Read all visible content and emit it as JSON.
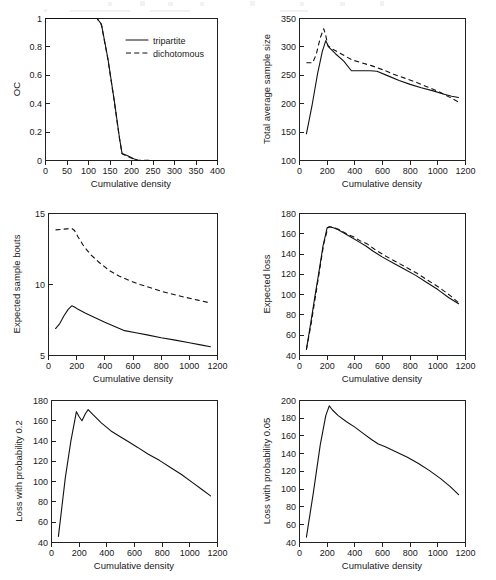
{
  "figure": {
    "panel_count": 6,
    "layout": "3 rows x 2 columns",
    "line_color": "#111111",
    "background": "#ffffff"
  },
  "legend": {
    "position": "inside panel 1, upper right",
    "entries": [
      {
        "label": "tripartite",
        "style": "solid"
      },
      {
        "label": "dichotomous",
        "style": "dashed"
      }
    ]
  },
  "chart_data": [
    {
      "type": "line",
      "title": "",
      "xlabel": "Cumulative density",
      "ylabel": "OC",
      "xlim": [
        0,
        400
      ],
      "ylim": [
        0,
        1
      ],
      "xticks": [
        0,
        50,
        100,
        150,
        200,
        250,
        300,
        350,
        400
      ],
      "yticks": [
        0,
        0.2,
        0.4,
        0.6,
        0.8,
        1
      ],
      "ytick_labels": [
        "0",
        "0.2",
        "0.4",
        "0.6",
        "0.8",
        "1"
      ],
      "grid": false,
      "legend": "upper right",
      "series": [
        {
          "name": "tripartite",
          "style": "solid",
          "x": [
            0,
            60,
            100,
            120,
            130,
            145,
            160,
            172,
            178,
            190,
            205,
            215,
            260,
            320,
            400
          ],
          "y": [
            1,
            1,
            1,
            1,
            0.96,
            0.72,
            0.42,
            0.16,
            0.05,
            0.035,
            0.012,
            0.002,
            0,
            0,
            0
          ]
        },
        {
          "name": "dichotomous",
          "style": "dashed",
          "x": [
            0,
            60,
            100,
            120,
            130,
            145,
            160,
            172,
            178,
            190,
            205,
            215,
            260,
            320,
            400
          ],
          "y": [
            1,
            1,
            1,
            1,
            0.955,
            0.715,
            0.415,
            0.155,
            0.048,
            0.03,
            0.01,
            0.002,
            0,
            0,
            0
          ]
        }
      ]
    },
    {
      "type": "line",
      "title": "",
      "xlabel": "Cumulative density",
      "ylabel": "Total average sample size",
      "xlim": [
        0,
        1200
      ],
      "ylim": [
        100,
        350
      ],
      "xticks": [
        0,
        200,
        400,
        600,
        800,
        1000,
        1200
      ],
      "yticks": [
        100,
        150,
        200,
        250,
        300,
        350
      ],
      "grid": false,
      "series": [
        {
          "name": "tripartite",
          "style": "solid",
          "x": [
            50,
            90,
            130,
            165,
            190,
            210,
            260,
            320,
            375,
            440,
            510,
            560,
            640,
            720,
            800,
            880,
            960,
            1040,
            1100,
            1150
          ],
          "y": [
            147,
            196,
            252,
            292,
            311,
            300,
            288,
            275,
            258,
            258,
            258,
            257,
            249,
            241,
            234,
            228,
            223,
            217,
            213,
            211
          ]
        },
        {
          "name": "dichotomous",
          "style": "dashed",
          "x": [
            50,
            95,
            120,
            150,
            175,
            190,
            205,
            240,
            300,
            380,
            450,
            520,
            600,
            680,
            760,
            840,
            920,
            1000,
            1080,
            1150
          ],
          "y": [
            272,
            272,
            286,
            316,
            332,
            320,
            302,
            296,
            288,
            277,
            272,
            267,
            260,
            252,
            245,
            238,
            230,
            222,
            212,
            203
          ]
        }
      ]
    },
    {
      "type": "line",
      "title": "",
      "xlabel": "Cumulative density",
      "ylabel": "Expected sample bouts",
      "xlim": [
        0,
        1200
      ],
      "ylim": [
        5,
        15
      ],
      "xticks": [
        0,
        200,
        400,
        600,
        800,
        1000,
        1200
      ],
      "yticks": [
        5,
        10,
        15
      ],
      "grid": false,
      "series": [
        {
          "name": "tripartite",
          "style": "solid",
          "x": [
            50,
            80,
            110,
            140,
            165,
            185,
            210,
            260,
            320,
            400,
            470,
            540,
            620,
            700,
            800,
            900,
            1000,
            1080,
            1150
          ],
          "y": [
            6.9,
            7.25,
            7.8,
            8.25,
            8.5,
            8.42,
            8.25,
            8.0,
            7.72,
            7.35,
            7.05,
            6.75,
            6.6,
            6.45,
            6.25,
            6.08,
            5.9,
            5.75,
            5.62
          ]
        },
        {
          "name": "dichotomous",
          "style": "dashed",
          "x": [
            50,
            90,
            130,
            165,
            185,
            210,
            250,
            300,
            360,
            430,
            500,
            570,
            650,
            730,
            810,
            890,
            970,
            1060,
            1150
          ],
          "y": [
            13.85,
            13.88,
            13.92,
            13.95,
            13.8,
            13.35,
            12.7,
            12.1,
            11.55,
            11.0,
            10.6,
            10.3,
            10.0,
            9.75,
            9.5,
            9.3,
            9.1,
            8.9,
            8.7
          ]
        }
      ]
    },
    {
      "type": "line",
      "title": "",
      "xlabel": "Cumulative density",
      "ylabel": "Expected loss",
      "xlim": [
        0,
        1200
      ],
      "ylim": [
        40,
        180
      ],
      "xticks": [
        0,
        200,
        400,
        600,
        800,
        1000,
        1200
      ],
      "yticks": [
        40,
        60,
        80,
        100,
        120,
        140,
        160,
        180
      ],
      "grid": false,
      "series": [
        {
          "name": "tripartite",
          "style": "solid",
          "x": [
            50,
            80,
            110,
            140,
            170,
            200,
            215,
            245,
            280,
            330,
            380,
            430,
            480,
            530,
            600,
            680,
            760,
            840,
            920,
            1000,
            1080,
            1150
          ],
          "y": [
            46,
            71,
            97,
            122,
            148,
            166,
            167,
            166,
            164,
            160,
            156,
            152,
            148,
            143,
            137,
            131,
            125,
            119,
            112,
            105,
            97,
            91
          ]
        },
        {
          "name": "dichotomous",
          "style": "dashed",
          "x": [
            50,
            85,
            115,
            145,
            175,
            205,
            220,
            250,
            290,
            340,
            390,
            440,
            490,
            540,
            610,
            690,
            770,
            850,
            930,
            1010,
            1090,
            1150
          ],
          "y": [
            46,
            72,
            98,
            124,
            150,
            166,
            167,
            166,
            164,
            160,
            157,
            153,
            150,
            145,
            139,
            133,
            127,
            121,
            114,
            107,
            99,
            92
          ]
        }
      ]
    },
    {
      "type": "line",
      "title": "",
      "xlabel": "Cumulative density",
      "ylabel": "Loss with probability 0.2",
      "xlim": [
        0,
        1200
      ],
      "ylim": [
        40,
        180
      ],
      "xticks": [
        0,
        200,
        400,
        600,
        800,
        1000,
        1200
      ],
      "yticks": [
        40,
        60,
        80,
        100,
        120,
        140,
        160,
        180
      ],
      "grid": false,
      "series": [
        {
          "name": "tripartite",
          "style": "solid",
          "x": [
            50,
            100,
            140,
            180,
            200,
            220,
            245,
            265,
            300,
            360,
            430,
            500,
            560,
            620,
            700,
            780,
            860,
            940,
            1020,
            1090,
            1150
          ],
          "y": [
            46,
            104,
            140,
            169,
            164,
            160,
            167,
            171,
            166,
            158,
            150,
            144,
            139,
            134,
            127,
            121,
            114,
            107,
            99,
            92,
            86
          ]
        }
      ]
    },
    {
      "type": "line",
      "title": "",
      "xlabel": "Cumulative density",
      "ylabel": "Loss with probability 0.05",
      "xlim": [
        0,
        1200
      ],
      "ylim": [
        40,
        200
      ],
      "xticks": [
        0,
        200,
        400,
        600,
        800,
        1000,
        1200
      ],
      "yticks": [
        40,
        60,
        80,
        100,
        120,
        140,
        160,
        180,
        200
      ],
      "grid": false,
      "series": [
        {
          "name": "tripartite",
          "style": "solid",
          "x": [
            50,
            100,
            150,
            190,
            215,
            240,
            280,
            340,
            400,
            460,
            520,
            570,
            620,
            700,
            780,
            860,
            940,
            1020,
            1090,
            1150
          ],
          "y": [
            46,
            96,
            150,
            183,
            194,
            189,
            183,
            176,
            170,
            163,
            156,
            151,
            148,
            142,
            136,
            129,
            121,
            112,
            103,
            94
          ]
        }
      ]
    }
  ]
}
